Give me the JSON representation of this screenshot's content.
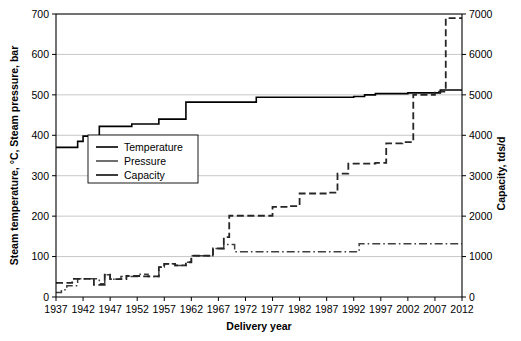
{
  "chart_data": {
    "type": "line",
    "title": "",
    "xlabel": "Delivery year",
    "ylabel": "Steam temperature, °C, Steam pressure, bar",
    "y2label": "Capacity, tds/d",
    "xlim": [
      1937,
      2012
    ],
    "xticks": [
      1937,
      1942,
      1947,
      1952,
      1957,
      1962,
      1967,
      1972,
      1977,
      1982,
      1987,
      1992,
      1997,
      2002,
      2007,
      2012
    ],
    "ylim": [
      0,
      700
    ],
    "yticks": [
      0,
      100,
      200,
      300,
      400,
      500,
      600,
      700
    ],
    "y2lim": [
      0,
      7000
    ],
    "y2ticks": [
      0,
      1000,
      2000,
      3000,
      4000,
      5000,
      6000,
      7000
    ],
    "grid": true,
    "grid_axis": "y",
    "legend_position": "center-left",
    "legend": [
      "Temperature",
      "Pressure",
      "Capacity"
    ],
    "series": [
      {
        "name": "Temperature",
        "axis": "left",
        "unit": "°C",
        "style": "solid",
        "color": "#000000",
        "width": 1.6,
        "step": "post",
        "points": [
          [
            1937,
            370
          ],
          [
            1941,
            370
          ],
          [
            1941,
            385
          ],
          [
            1942,
            385
          ],
          [
            1942,
            398
          ],
          [
            1945,
            398
          ],
          [
            1945,
            422
          ],
          [
            1951,
            422
          ],
          [
            1951,
            428
          ],
          [
            1956,
            428
          ],
          [
            1956,
            440
          ],
          [
            1961,
            440
          ],
          [
            1961,
            482
          ],
          [
            1974,
            482
          ],
          [
            1974,
            494
          ],
          [
            1992,
            494
          ],
          [
            1992,
            496
          ],
          [
            1994,
            496
          ],
          [
            1994,
            500
          ],
          [
            1996,
            500
          ],
          [
            1996,
            503
          ],
          [
            2002,
            503
          ],
          [
            2002,
            505
          ],
          [
            2008,
            505
          ],
          [
            2008,
            512
          ],
          [
            2012,
            512
          ]
        ]
      },
      {
        "name": "Pressure",
        "axis": "left",
        "unit": "bar",
        "style": "dashdot",
        "color": "#3f3f3f",
        "width": 1.5,
        "step": "post",
        "points": [
          [
            1937,
            11
          ],
          [
            1938,
            11
          ],
          [
            1938,
            18
          ],
          [
            1939,
            18
          ],
          [
            1939,
            28
          ],
          [
            1941,
            28
          ],
          [
            1941,
            45
          ],
          [
            1945,
            45
          ],
          [
            1945,
            33
          ],
          [
            1946,
            33
          ],
          [
            1946,
            55
          ],
          [
            1947,
            55
          ],
          [
            1947,
            44
          ],
          [
            1949,
            44
          ],
          [
            1949,
            51
          ],
          [
            1952,
            51
          ],
          [
            1952,
            56
          ],
          [
            1954,
            56
          ],
          [
            1954,
            51
          ],
          [
            1956,
            51
          ],
          [
            1956,
            74
          ],
          [
            1957,
            74
          ],
          [
            1957,
            82
          ],
          [
            1959,
            82
          ],
          [
            1959,
            78
          ],
          [
            1961,
            78
          ],
          [
            1961,
            86
          ],
          [
            1962,
            86
          ],
          [
            1962,
            102
          ],
          [
            1966,
            102
          ],
          [
            1966,
            120
          ],
          [
            1968,
            120
          ],
          [
            1968,
            130
          ],
          [
            1970,
            130
          ],
          [
            1970,
            112
          ],
          [
            1993,
            112
          ],
          [
            1993,
            132
          ],
          [
            2012,
            132
          ]
        ]
      },
      {
        "name": "Capacity",
        "axis": "right",
        "unit": "tds/d",
        "style": "dashed",
        "color": "#262626",
        "width": 1.8,
        "step": "post",
        "points": [
          [
            1937,
            350
          ],
          [
            1940,
            350
          ],
          [
            1940,
            450
          ],
          [
            1944,
            450
          ],
          [
            1944,
            300
          ],
          [
            1946,
            300
          ],
          [
            1946,
            550
          ],
          [
            1947,
            550
          ],
          [
            1947,
            440
          ],
          [
            1950,
            440
          ],
          [
            1950,
            520
          ],
          [
            1953,
            520
          ],
          [
            1953,
            510
          ],
          [
            1956,
            510
          ],
          [
            1956,
            740
          ],
          [
            1957,
            740
          ],
          [
            1957,
            820
          ],
          [
            1959,
            820
          ],
          [
            1959,
            780
          ],
          [
            1961,
            780
          ],
          [
            1961,
            860
          ],
          [
            1962,
            860
          ],
          [
            1962,
            1020
          ],
          [
            1966,
            1020
          ],
          [
            1966,
            1200
          ],
          [
            1968,
            1200
          ],
          [
            1968,
            1480
          ],
          [
            1969,
            1480
          ],
          [
            1969,
            2010
          ],
          [
            1977,
            2010
          ],
          [
            1977,
            2230
          ],
          [
            1980,
            2230
          ],
          [
            1980,
            2250
          ],
          [
            1982,
            2250
          ],
          [
            1982,
            2560
          ],
          [
            1987,
            2560
          ],
          [
            1987,
            2580
          ],
          [
            1989,
            2580
          ],
          [
            1989,
            3050
          ],
          [
            1991,
            3050
          ],
          [
            1991,
            3300
          ],
          [
            1996,
            3300
          ],
          [
            1996,
            3320
          ],
          [
            1998,
            3320
          ],
          [
            1998,
            3800
          ],
          [
            2001,
            3800
          ],
          [
            2001,
            3830
          ],
          [
            2003,
            3830
          ],
          [
            2003,
            5000
          ],
          [
            2007,
            5000
          ],
          [
            2007,
            5080
          ],
          [
            2009,
            5080
          ],
          [
            2009,
            6900
          ],
          [
            2012,
            6900
          ]
        ]
      }
    ]
  }
}
